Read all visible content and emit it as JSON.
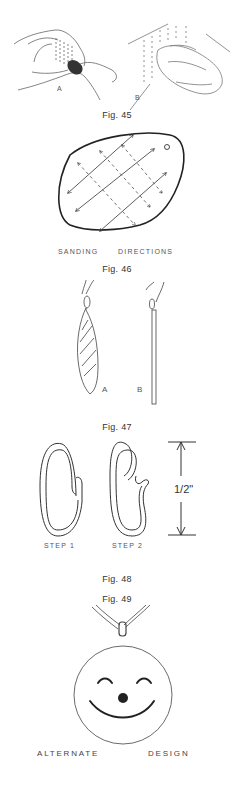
{
  "figures": [
    {
      "id": "fig45",
      "caption": "Fig. 45",
      "labels": {
        "a": "A",
        "b": "B"
      }
    },
    {
      "id": "fig46",
      "caption": "Fig. 46",
      "label_left": "SANDING",
      "label_right": "DIRECTIONS"
    },
    {
      "id": "fig47",
      "caption": "Fig. 47",
      "labels": {
        "a": "A",
        "b": "B"
      }
    },
    {
      "id": "fig48",
      "caption": "Fig. 48",
      "step1": "STEP 1",
      "step2": "STEP 2",
      "dimension": "1/2\""
    },
    {
      "id": "fig49",
      "caption": "Fig. 49",
      "design_left": "ALTERNATE",
      "design_right": "DESIGN"
    }
  ]
}
